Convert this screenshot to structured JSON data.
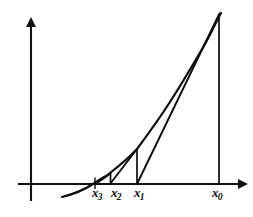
{
  "figure": {
    "background_color": "#ffffff",
    "ink_color": "#0d0d0d",
    "width": 253,
    "height": 217
  },
  "axes": {
    "x_axis": {
      "name": "horizontal-axis",
      "y_pixel": 184,
      "x_start": 18,
      "x_end": 243,
      "arrow": "right"
    },
    "y_axis": {
      "name": "vertical-axis",
      "x_pixel": 31,
      "y_start": 201,
      "y_end": 20,
      "arrow": "up"
    },
    "origin": {
      "x": 31,
      "y": 184
    }
  },
  "curve": {
    "name": "function-curve",
    "description": "increasing convex curve crossing the x-axis near x3",
    "root_x_pixel": 93,
    "points": [
      {
        "x": 62,
        "y": 197
      },
      {
        "x": 78,
        "y": 192
      },
      {
        "x": 93,
        "y": 184
      },
      {
        "x": 110,
        "y": 173
      },
      {
        "x": 125,
        "y": 160
      },
      {
        "x": 137,
        "y": 149
      },
      {
        "x": 160,
        "y": 117
      },
      {
        "x": 185,
        "y": 74
      },
      {
        "x": 205,
        "y": 40
      },
      {
        "x": 221,
        "y": 13
      }
    ]
  },
  "tangents": [
    {
      "name": "tangent-at-x0",
      "from": {
        "x": 219,
        "y": 13
      },
      "to": {
        "x": 137,
        "y": 184
      }
    },
    {
      "name": "tangent-at-x1",
      "from": {
        "x": 137,
        "y": 149
      },
      "to": {
        "x": 110,
        "y": 184
      }
    },
    {
      "name": "tangent-at-x2",
      "from": {
        "x": 110,
        "y": 173
      },
      "to": {
        "x": 95,
        "y": 184
      }
    }
  ],
  "drop_lines": [
    {
      "name": "ordinate-at-x0",
      "x": 219,
      "y_top": 13,
      "y_bottom": 184
    },
    {
      "name": "ordinate-at-x1",
      "x": 137,
      "y_top": 149,
      "y_bottom": 184
    },
    {
      "name": "ordinate-at-x2",
      "x": 110,
      "y_top": 173,
      "y_bottom": 184
    }
  ],
  "tick_marks": [
    {
      "name": "tick-x3",
      "x": 95,
      "y_top": 178,
      "y_bottom": 189
    }
  ],
  "labels": [
    {
      "name": "axis-label-x3",
      "base": "x",
      "subscript": "3",
      "left": 92,
      "top": 186
    },
    {
      "name": "axis-label-x2",
      "base": "x",
      "subscript": "2",
      "left": 111,
      "top": 186
    },
    {
      "name": "axis-label-x1",
      "base": "x",
      "subscript": "1",
      "left": 134,
      "top": 186
    },
    {
      "name": "axis-label-x0",
      "base": "x",
      "subscript": "0",
      "left": 212,
      "top": 186
    }
  ]
}
